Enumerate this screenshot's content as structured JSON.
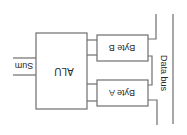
{
  "diagram": {
    "type": "block-diagram",
    "orientation": "rotated-180",
    "nodes": {
      "alu": {
        "label": "ALU"
      },
      "byte_b": {
        "label": "Byte B"
      },
      "byte_a": {
        "label": "Byte A"
      }
    },
    "labels": {
      "sum": "Sum",
      "data_bus": "Data bus"
    },
    "edges": [
      {
        "from": "byte_b",
        "to": "alu",
        "count": 2
      },
      {
        "from": "byte_a",
        "to": "alu",
        "count": 2
      },
      {
        "from": "data_bus",
        "to": "byte_b"
      },
      {
        "from": "data_bus",
        "to": "byte_a"
      },
      {
        "from": "alu",
        "to": "sum"
      }
    ],
    "colors": {
      "line": "#6e6e6e",
      "text": "#2a2a2a",
      "background": "#ffffff"
    }
  }
}
